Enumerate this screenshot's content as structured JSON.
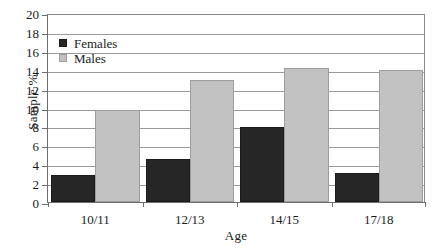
{
  "chart_data": {
    "type": "bar",
    "title": "",
    "xlabel": "Age",
    "ylabel": "Sample %",
    "categories": [
      "10/11",
      "12/13",
      "14/15",
      "17/18"
    ],
    "series": [
      {
        "name": "Females",
        "color": "#262626",
        "values": [
          2.9,
          4.6,
          7.9,
          3.1
        ]
      },
      {
        "name": "Males",
        "color": "#c2c2c2",
        "values": [
          9.7,
          12.9,
          14.2,
          14.0
        ]
      }
    ],
    "ylim": [
      0,
      20
    ],
    "ytick_step": 2,
    "yticks": [
      "20",
      "18",
      "16",
      "14",
      "12",
      "10",
      "8",
      "6",
      "4",
      "2",
      "0"
    ],
    "grid": true,
    "legend_position": "upper-left-inside"
  }
}
